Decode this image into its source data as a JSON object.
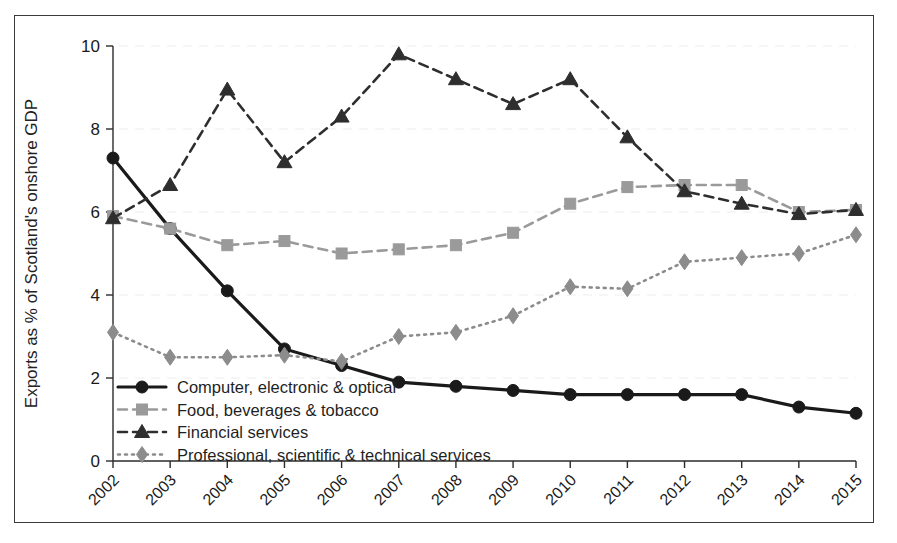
{
  "chart_data": {
    "type": "line",
    "title": "",
    "xlabel": "",
    "ylabel": "Exports as % of Scotland's onshore GDP",
    "x": [
      "2002",
      "2003",
      "2004",
      "2005",
      "2006",
      "2007",
      "2008",
      "2009",
      "2010",
      "2011",
      "2012",
      "2013",
      "2014",
      "2015"
    ],
    "xtick_labels": [
      "2002",
      "2003",
      "2004",
      "2005",
      "2006",
      "2007",
      "2008",
      "2009",
      "2010",
      "2011",
      "2012",
      "2013",
      "2014",
      "2015"
    ],
    "ytick_labels": [
      "0",
      "2",
      "4",
      "6",
      "8",
      "10"
    ],
    "yticks": [
      0,
      2,
      4,
      6,
      8,
      10
    ],
    "ylim": [
      0,
      10
    ],
    "grid": "faint-horizontal",
    "legend_position": "lower-left-inside",
    "series": [
      {
        "name": "Computer, electronic & optical",
        "marker": "circle",
        "line_style": "solid",
        "color": "#1a1a1a",
        "values": [
          7.3,
          5.6,
          4.1,
          2.7,
          2.3,
          1.9,
          1.8,
          1.7,
          1.6,
          1.6,
          1.6,
          1.6,
          1.3,
          1.15
        ]
      },
      {
        "name": "Food, beverages & tobacco",
        "marker": "square",
        "line_style": "dashed",
        "color": "#9a9a9a",
        "values": [
          5.9,
          5.6,
          5.2,
          5.3,
          5.0,
          5.1,
          5.2,
          5.5,
          6.2,
          6.6,
          6.65,
          6.65,
          6.0,
          6.05
        ]
      },
      {
        "name": "Financial services",
        "marker": "triangle",
        "line_style": "dashed",
        "color": "#2e2e2e",
        "values": [
          5.85,
          6.65,
          8.95,
          7.2,
          8.3,
          9.8,
          9.2,
          8.6,
          9.2,
          7.8,
          6.5,
          6.2,
          5.95,
          6.05
        ]
      },
      {
        "name": "Professional, scientific & technical services",
        "marker": "diamond",
        "line_style": "dotted",
        "color": "#8c8c8c",
        "values": [
          3.1,
          2.5,
          2.5,
          2.55,
          2.4,
          3.0,
          3.1,
          3.5,
          4.2,
          4.15,
          4.8,
          4.9,
          5.0,
          5.45
        ]
      }
    ]
  },
  "legend": {
    "items": [
      {
        "label": "Computer, electronic & optical"
      },
      {
        "label": "Food, beverages & tobacco"
      },
      {
        "label": "Financial services"
      },
      {
        "label": "Professional, scientific & technical services"
      }
    ]
  }
}
